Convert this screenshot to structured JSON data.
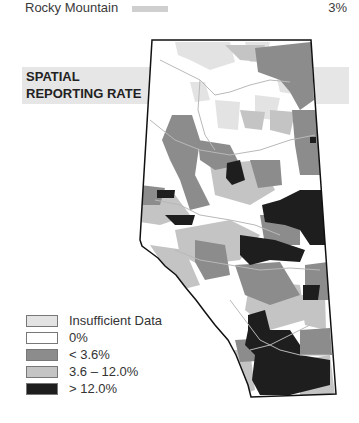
{
  "header": {
    "region_name": "Rocky Mountain",
    "region_percent": "3%"
  },
  "title": {
    "line1": "SPATIAL",
    "line2": "REPORTING RATE"
  },
  "colors": {
    "insufficient": "#e3e3e3",
    "zero": "#ffffff",
    "low": "#8c8c8c",
    "mid": "#c4c4c4",
    "high": "#1e1e1e",
    "band": "#e6e6e6",
    "outline": "#111111",
    "rivers": "#b8b8b8"
  },
  "legend": {
    "items": [
      {
        "label": "Insufficient Data",
        "color": "#e3e3e3"
      },
      {
        "label": "0%",
        "color": "#ffffff"
      },
      {
        "label": "< 3.6%",
        "color": "#8c8c8c"
      },
      {
        "label": "3.6 – 12.0%",
        "color": "#c4c4c4"
      },
      {
        "label": "> 12.0%",
        "color": "#1e1e1e"
      }
    ]
  }
}
